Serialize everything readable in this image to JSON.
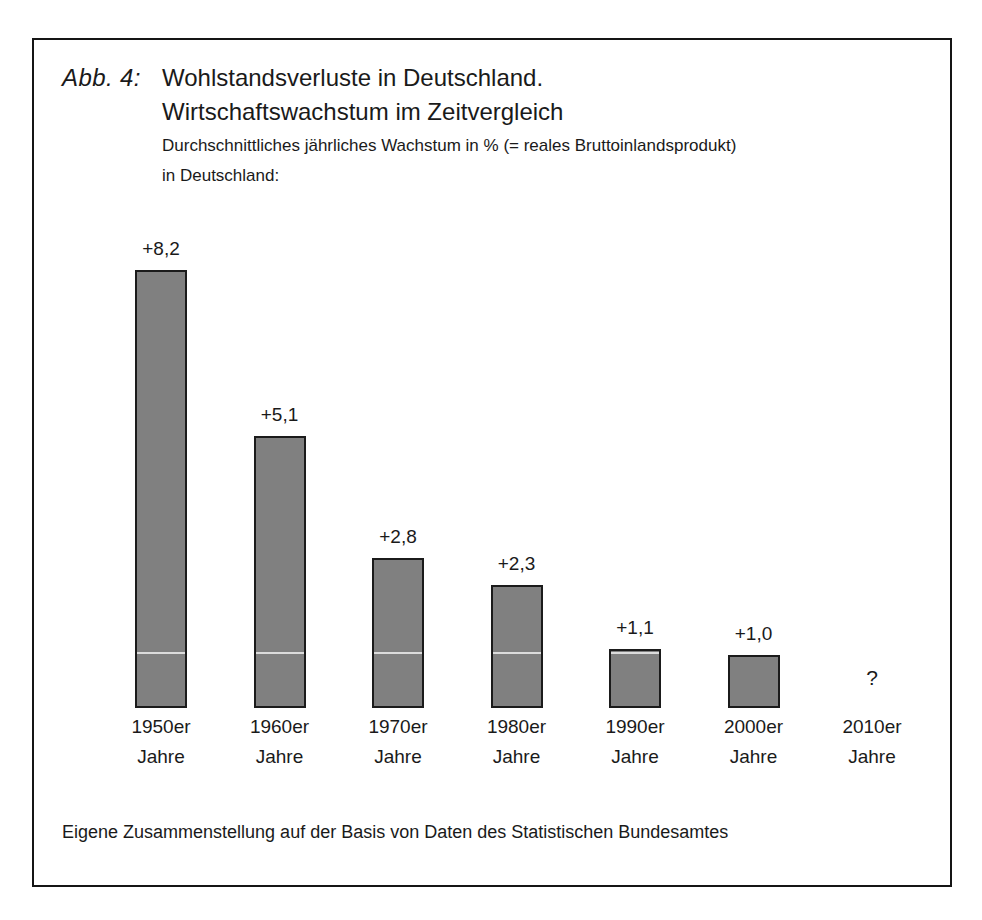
{
  "figure": {
    "number_label": "Abb. 4:",
    "title_line1": "Wohlstandsverluste in Deutschland.",
    "title_line2": "Wirtschaftswachstum im Zeitvergleich",
    "subtitle_line1": "Durchschnittliches jährliches Wachstum in % (= reales Bruttoinlandsprodukt)",
    "subtitle_line2": "in Deutschland:",
    "source_note": "Eigene Zusammenstellung auf der Basis von Daten des Statistischen Bundesamtes",
    "unknown_marker": "?"
  },
  "colors": {
    "bar_fill": "#808080",
    "bar_border": "#1b1b1b",
    "frame_border": "#151515",
    "background": "#ffffff",
    "text": "#1a1a1a"
  },
  "chart_data": {
    "type": "bar",
    "title": "Wohlstandsverluste in Deutschland. Wirtschaftswachstum im Zeitvergleich",
    "subtitle": "Durchschnittliches jährliches Wachstum in % (= reales Bruttoinlandsprodukt) in Deutschland:",
    "xlabel": "",
    "ylabel": "Durchschnittliches jährliches Wachstum in %",
    "ylim": [
      0,
      8.2
    ],
    "grid": false,
    "legend": "none",
    "categories": [
      "1950er Jahre",
      "1960er Jahre",
      "1970er Jahre",
      "1980er Jahre",
      "1990er Jahre",
      "2000er Jahre",
      "2010er Jahre"
    ],
    "values": [
      8.2,
      5.1,
      2.8,
      2.3,
      1.1,
      1.0,
      null
    ],
    "data_labels": [
      "+8,2",
      "+5,1",
      "+2,8",
      "+2,3",
      "+1,1",
      "+1,0",
      "?"
    ],
    "bars": [
      {
        "cat_line1": "1950er",
        "cat_line2": "Jahre",
        "value": 8.2,
        "label": "+8,2",
        "has_bar": true
      },
      {
        "cat_line1": "1960er",
        "cat_line2": "Jahre",
        "value": 5.1,
        "label": "+5,1",
        "has_bar": true
      },
      {
        "cat_line1": "1970er",
        "cat_line2": "Jahre",
        "value": 2.8,
        "label": "+2,8",
        "has_bar": true
      },
      {
        "cat_line1": "1980er",
        "cat_line2": "Jahre",
        "value": 2.3,
        "label": "+2,3",
        "has_bar": true
      },
      {
        "cat_line1": "1990er",
        "cat_line2": "Jahre",
        "value": 1.1,
        "label": "+1,1",
        "has_bar": true
      },
      {
        "cat_line1": "2000er",
        "cat_line2": "Jahre",
        "value": 1.0,
        "label": "+1,0",
        "has_bar": true
      },
      {
        "cat_line1": "2010er",
        "cat_line2": "Jahre",
        "value": null,
        "label": "?",
        "has_bar": false
      }
    ],
    "annotations": [
      "Eigene Zusammenstellung auf der Basis von Daten des Statistischen Bundesamtes"
    ]
  }
}
